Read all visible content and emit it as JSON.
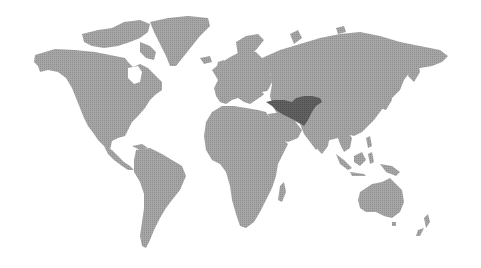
{
  "map": {
    "type": "world-choropleth",
    "style": "grey halftone",
    "colors": {
      "background": "#ffffff",
      "land": "#a3a3a3",
      "land_dot": "#8c8c8c",
      "highlight": "#5f5f5f",
      "highlight_dot": "#4a4a4a"
    },
    "highlighted_region": {
      "label": "Middle East / Central Asia",
      "countries": [
        "Turkey",
        "Iran",
        "Afghanistan"
      ]
    },
    "regions": [
      "North America",
      "Greenland",
      "South America",
      "Europe",
      "Africa",
      "Asia",
      "Southeast Asia",
      "Australia",
      "New Zealand",
      "Madagascar",
      "Japan"
    ]
  }
}
